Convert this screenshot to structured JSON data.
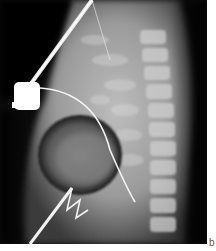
{
  "figure": {
    "type": "lateral chest radiograph",
    "panel_label": "b",
    "colors": {
      "background_dark": "#0a0a0a",
      "soft_tissue": "#8a8a8a",
      "bone_bright": "#d8d8d8",
      "device_white": "#ffffff",
      "margin": "#ffffff"
    },
    "elements": [
      {
        "name": "implanted-device",
        "description": "bright white generator/port"
      },
      {
        "name": "lead-wire",
        "description": "thin curved lead extending from device through heart shadow"
      },
      {
        "name": "catheter-upper",
        "description": "straight catheter extending up and right from device"
      },
      {
        "name": "catheter-lower",
        "description": "zig-zag wire at the lower left"
      },
      {
        "name": "spine",
        "description": "vertebral column on the right"
      },
      {
        "name": "heart-shadow",
        "description": "dark rounded cardiac outline"
      }
    ]
  }
}
